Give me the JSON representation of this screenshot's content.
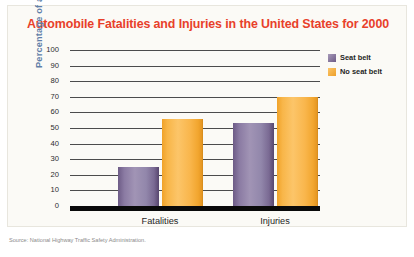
{
  "card": {
    "title": "Automobile Fatalities and Injuries in the United States for 2000"
  },
  "source_note": "Source: National Highway Traffic Safety Administration.",
  "legend": {
    "items": [
      {
        "label": "Seat belt",
        "color": "#6d5b86"
      },
      {
        "label": "No seat belt",
        "color": "#f5a92f"
      }
    ]
  },
  "chart_data": {
    "type": "bar",
    "title": "Automobile Fatalities and Injuries in the United States for 2000",
    "xlabel": "",
    "ylabel": "Percentage of accidents",
    "categories": [
      "Fatalities",
      "Injuries"
    ],
    "series": [
      {
        "name": "Seat belt",
        "color": "#6d5b86",
        "values": [
          25,
          53
        ]
      },
      {
        "name": "No seat belt",
        "color": "#f5a92f",
        "values": [
          56,
          70
        ]
      }
    ],
    "ylim": [
      0,
      100
    ],
    "ytick_labels": [
      "100",
      "90",
      "80",
      "70",
      "60",
      "50",
      "40",
      "30",
      "20",
      "10",
      "0"
    ],
    "ytick_values": [
      100,
      90,
      80,
      70,
      60,
      50,
      40,
      30,
      20,
      10,
      0
    ],
    "grid": true,
    "legend_position": "top-right"
  }
}
